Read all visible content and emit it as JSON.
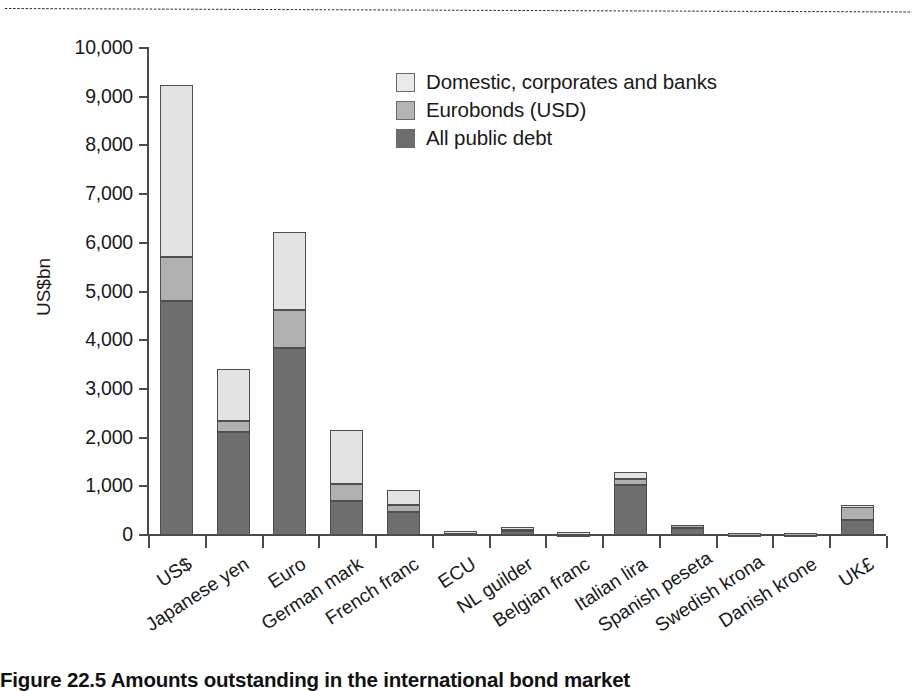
{
  "figure": {
    "caption": "Figure 22.5 Amounts outstanding in the international bond market",
    "top_rule": "dotted-rule"
  },
  "chart_data": {
    "type": "bar",
    "stacked": true,
    "title": "",
    "xlabel": "",
    "ylabel": "US$bn",
    "ylim": [
      0,
      10000
    ],
    "ytick_step": 1000,
    "grid": false,
    "legend_position": "top-center",
    "yticks": [
      "0",
      "1,000",
      "2,000",
      "3,000",
      "4,000",
      "5,000",
      "6,000",
      "7,000",
      "8,000",
      "9,000",
      "10,000"
    ],
    "ytick_values": [
      0,
      1000,
      2000,
      3000,
      4000,
      5000,
      6000,
      7000,
      8000,
      9000,
      10000
    ],
    "categories": [
      "US$",
      "Japanese yen",
      "Euro",
      "German mark",
      "French franc",
      "ECU",
      "NL guilder",
      "Belgian franc",
      "Italian lira",
      "Spanish peseta",
      "Swedish krona",
      "Danish krone",
      "UK£"
    ],
    "series": [
      {
        "name": "All public debt",
        "color": "#6e6e6e",
        "values": [
          4800,
          2120,
          3830,
          700,
          480,
          40,
          90,
          30,
          1030,
          150,
          20,
          15,
          300
        ]
      },
      {
        "name": "Eurobonds (USD)",
        "color": "#b0b0b0",
        "values": [
          900,
          230,
          790,
          350,
          140,
          25,
          60,
          20,
          120,
          55,
          25,
          20,
          300
        ]
      },
      {
        "name": "Domestic, corporates and banks",
        "color": "#e3e3e3",
        "values": [
          3550,
          1050,
          1600,
          1100,
          310,
          10,
          10,
          10,
          150,
          0,
          0,
          0,
          10
        ]
      }
    ],
    "totals": [
      9250,
      3400,
      6220,
      2150,
      930,
      75,
      160,
      60,
      1300,
      205,
      45,
      35,
      610
    ]
  },
  "legend": {
    "items": [
      {
        "label": "Domestic, corporates and banks",
        "swatch": "light-grey-swatch"
      },
      {
        "label": "Eurobonds (USD)",
        "swatch": "mid-grey-swatch"
      },
      {
        "label": "All public debt",
        "swatch": "dark-grey-swatch"
      }
    ]
  }
}
